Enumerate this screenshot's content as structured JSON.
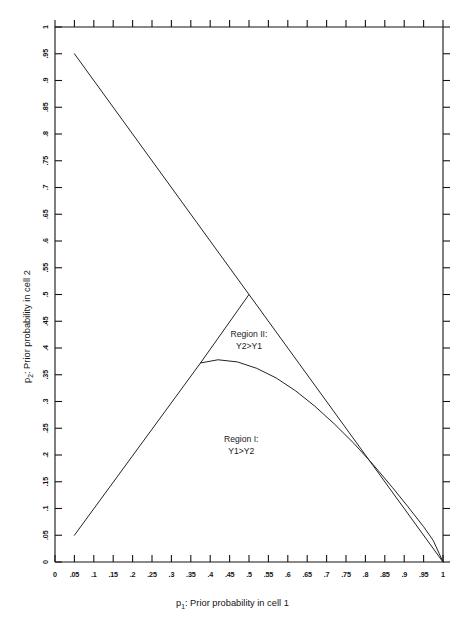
{
  "chart_data": {
    "type": "line",
    "title": "",
    "xlabel_prefix": "p",
    "xlabel_sub": "1",
    "xlabel_rest": ":  Prior probability in cell 1",
    "ylabel_prefix": "p",
    "ylabel_sub": "2",
    "ylabel_rest": ":  Prior probability in cell 2",
    "xlim": [
      0,
      1
    ],
    "ylim": [
      0,
      1
    ],
    "grid": false,
    "legend_position": "none",
    "xticks": [
      0,
      0.05,
      0.1,
      0.15,
      0.2,
      0.25,
      0.3,
      0.35,
      0.4,
      0.45,
      0.5,
      0.55,
      0.6,
      0.65,
      0.7,
      0.75,
      0.8,
      0.85,
      0.9,
      0.95,
      1
    ],
    "xtick_labels": [
      "0",
      ".05",
      ".1",
      ".15",
      ".2",
      ".25",
      ".3",
      ".35",
      ".4",
      ".45",
      ".5",
      ".55",
      ".6",
      ".65",
      ".7",
      ".75",
      ".8",
      ".85",
      ".9",
      ".95",
      "1"
    ],
    "yticks": [
      0,
      0.05,
      0.1,
      0.15,
      0.2,
      0.25,
      0.3,
      0.35,
      0.4,
      0.45,
      0.5,
      0.55,
      0.6,
      0.65,
      0.7,
      0.75,
      0.8,
      0.85,
      0.9,
      0.95,
      1
    ],
    "ytick_labels": [
      "0",
      ".05",
      ".1",
      ".15",
      ".2",
      ".25",
      ".3",
      ".35",
      ".4",
      ".45",
      ".5",
      ".55",
      ".6",
      ".65",
      ".7",
      ".75",
      ".8",
      ".85",
      ".9",
      ".95",
      "1"
    ],
    "series": [
      {
        "name": "upper-boundary-line",
        "description": "Descending straight line p1+p2=1",
        "points": [
          [
            0.05,
            0.95
          ],
          [
            0.5,
            0.5
          ],
          [
            1.0,
            0.0
          ]
        ]
      },
      {
        "name": "rising-boundary-line",
        "description": "Ascending straight line p2=p1 from (0.05,0.05) to apex (0.5,0.5)",
        "points": [
          [
            0.05,
            0.05
          ],
          [
            0.375,
            0.372
          ],
          [
            0.5,
            0.5
          ]
        ]
      },
      {
        "name": "region-divider-curve",
        "description": "Curve branching from (0.375,0.372) descending to (1,0)",
        "points": [
          [
            0.375,
            0.372
          ],
          [
            0.42,
            0.378
          ],
          [
            0.47,
            0.374
          ],
          [
            0.52,
            0.362
          ],
          [
            0.57,
            0.344
          ],
          [
            0.62,
            0.32
          ],
          [
            0.67,
            0.291
          ],
          [
            0.72,
            0.258
          ],
          [
            0.77,
            0.222
          ],
          [
            0.82,
            0.182
          ],
          [
            0.87,
            0.139
          ],
          [
            0.91,
            0.103
          ],
          [
            0.95,
            0.066
          ],
          [
            0.975,
            0.04
          ],
          [
            1.0,
            0.0
          ]
        ]
      }
    ],
    "annotations": [
      {
        "name": "region-two-label",
        "line1": "Region II:",
        "line2": "Y2>Y1",
        "x": 0.5,
        "y": 0.42
      },
      {
        "name": "region-one-label",
        "line1": "Region I:",
        "line2": "Y1>Y2",
        "x": 0.48,
        "y": 0.225
      }
    ]
  }
}
